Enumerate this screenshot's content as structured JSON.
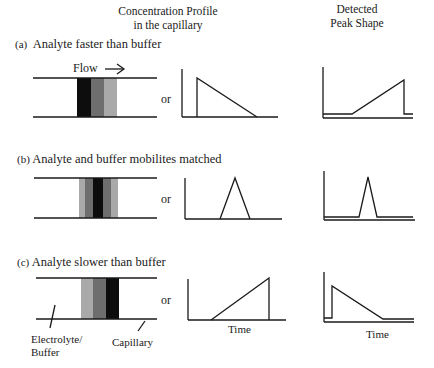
{
  "headers": {
    "profile_line1": "Concentration Profile",
    "profile_line2": "in the capillary",
    "detected_line1": "Detected",
    "detected_line2": "Peak Shape"
  },
  "panels": [
    {
      "letter": "(a)",
      "title": "Analyte faster than buffer",
      "flow_label": "Flow",
      "or_label": "or",
      "band_order": [
        "black",
        "dark-gray",
        "light-gray"
      ],
      "profile_shape": "sharp front, tailing to the right",
      "detected_shape": "gradual rise, sharp drop (fronting)"
    },
    {
      "letter": "(b)",
      "title": "Analyte and buffer mobilites matched",
      "or_label": "or",
      "band_order": [
        "light-gray",
        "dark-gray",
        "black",
        "dark-gray",
        "light-gray"
      ],
      "profile_shape": "symmetric triangle",
      "detected_shape": "narrow symmetric peak"
    },
    {
      "letter": "(c)",
      "title": "Analyte slower than buffer",
      "or_label": "or",
      "band_order": [
        "light-gray",
        "dark-gray",
        "black"
      ],
      "profile_shape": "gradual rise, sharp drop",
      "detected_shape": "sharp rise, tailing (tailing peak)",
      "x_axis_label": "Time",
      "callouts": {
        "electrolyte_line1": "Electrolyte/",
        "electrolyte_line2": "Buffer",
        "capillary": "Capillary"
      }
    }
  ],
  "colors": {
    "line": "#1a1a1a",
    "band_black": "#0d0d0d",
    "band_dark": "#6e6e6e",
    "band_light": "#a9a9a9"
  }
}
